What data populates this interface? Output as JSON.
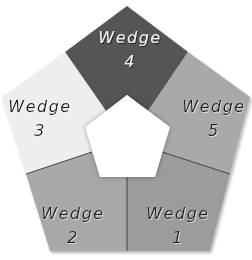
{
  "diagram": {
    "shape": "pentagon-ring",
    "inner_fill": "#ffffff",
    "wedges": [
      {
        "id": 1,
        "line1": "Wedge",
        "line2": "1",
        "color": "#9a9a9a",
        "text_color": "#1a1a1a"
      },
      {
        "id": 2,
        "line1": "Wedge",
        "line2": "2",
        "color": "#a8a8a8",
        "text_color": "#1a1a1a"
      },
      {
        "id": 3,
        "line1": "Wedge",
        "line2": "3",
        "color": "#eeeeee",
        "text_color": "#1a1a1a"
      },
      {
        "id": 4,
        "line1": "Wedge",
        "line2": "4",
        "color": "#555555",
        "text_color": "#f2f2f2"
      },
      {
        "id": 5,
        "line1": "Wedge",
        "line2": "5",
        "color": "#a9a9a9",
        "text_color": "#1a1a1a"
      }
    ]
  }
}
